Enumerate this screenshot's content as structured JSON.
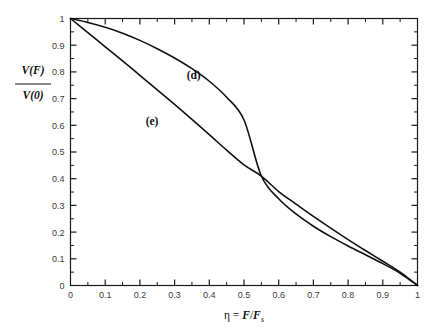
{
  "figure": {
    "title": "",
    "background_color": "#ffffff",
    "axis_color": "#1a1a1a",
    "curve_color": "#111111",
    "ticklabel_color": "#3b3b3b"
  },
  "axes": {
    "x": {
      "label_parts": {
        "eta": "η",
        "equals": " = ",
        "numerator": "F",
        "slash": "/",
        "denominator": "F",
        "subscript": "s"
      },
      "label_plain": "η = F/F_s",
      "min": 0,
      "max": 1,
      "major_step": 0.1,
      "minor_step": 0.05,
      "tick_labels": [
        "0",
        "0.1",
        "0.2",
        "0.3",
        "0.4",
        "0.5",
        "0.6",
        "0.7",
        "0.8",
        "0.9",
        "1"
      ],
      "tick_values": [
        0,
        0.1,
        0.2,
        0.3,
        0.4,
        0.5,
        0.6,
        0.7,
        0.8,
        0.9,
        1
      ]
    },
    "y": {
      "label_parts": {
        "numerator_fn": "V",
        "numerator_arg": "(F)",
        "denominator_fn": "V",
        "denominator_arg": "(0)"
      },
      "label_plain": "V(F)/V(0)",
      "min": 0,
      "max": 1,
      "major_step": 0.1,
      "minor_step": 0.05,
      "tick_labels": [
        "0",
        "0.1",
        "0.2",
        "0.3",
        "0.4",
        "0.5",
        "0.6",
        "0.7",
        "0.8",
        "0.9",
        "1"
      ],
      "tick_values": [
        0,
        0.1,
        0.2,
        0.3,
        0.4,
        0.5,
        0.6,
        0.7,
        0.8,
        0.9,
        1
      ]
    }
  },
  "chart_data": {
    "type": "line",
    "title": "",
    "xlabel": "η = F/F_s",
    "ylabel": "V(F)/V(0)",
    "xlim": [
      0,
      1
    ],
    "ylim": [
      0,
      1
    ],
    "grid": false,
    "legend": "inline-annotations",
    "annotations": [
      {
        "text": "(d)",
        "x": 0.355,
        "y": 0.775
      },
      {
        "text": "(e)",
        "x": 0.235,
        "y": 0.6
      }
    ],
    "crossing_point": {
      "x": 0.55,
      "y": 0.41
    },
    "series": [
      {
        "name": "(d)",
        "label": "(d)",
        "description": "sigmoidal curve, flat near eta=0, steep descent near eta=1",
        "x": [
          0,
          0.05,
          0.1,
          0.15,
          0.2,
          0.25,
          0.3,
          0.35,
          0.4,
          0.45,
          0.5,
          0.55,
          0.6,
          0.65,
          0.7,
          0.75,
          0.8,
          0.85,
          0.9,
          0.95,
          1.0
        ],
        "values": [
          1.0,
          0.985,
          0.967,
          0.945,
          0.918,
          0.887,
          0.852,
          0.812,
          0.765,
          0.705,
          0.62,
          0.41,
          0.325,
          0.268,
          0.222,
          0.183,
          0.148,
          0.115,
          0.082,
          0.046,
          0.0
        ]
      },
      {
        "name": "(e)",
        "label": "(e)",
        "description": "monotonic decreasing curve, steeper at small eta, shallow tail approaching eta=1",
        "x": [
          0,
          0.05,
          0.1,
          0.15,
          0.2,
          0.25,
          0.3,
          0.35,
          0.4,
          0.45,
          0.5,
          0.55,
          0.6,
          0.65,
          0.7,
          0.75,
          0.8,
          0.85,
          0.9,
          0.95,
          1.0
        ],
        "values": [
          1.0,
          0.947,
          0.894,
          0.841,
          0.787,
          0.733,
          0.678,
          0.622,
          0.565,
          0.507,
          0.452,
          0.41,
          0.352,
          0.305,
          0.259,
          0.215,
          0.172,
          0.131,
          0.091,
          0.05,
          0.0
        ]
      }
    ]
  }
}
